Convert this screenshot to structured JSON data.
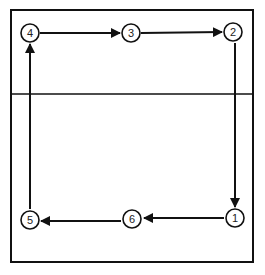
{
  "diagram": {
    "type": "flow-sequence",
    "court": {
      "outer": {
        "x": 11,
        "y": 10,
        "w": 242,
        "h": 252
      },
      "divider_y": 94
    },
    "nodes": [
      {
        "id": "1",
        "label": "1",
        "x": 235,
        "y": 218
      },
      {
        "id": "2",
        "label": "2",
        "x": 233,
        "y": 32
      },
      {
        "id": "3",
        "label": "3",
        "x": 131,
        "y": 33
      },
      {
        "id": "4",
        "label": "4",
        "x": 30,
        "y": 33
      },
      {
        "id": "5",
        "label": "5",
        "x": 30,
        "y": 220
      },
      {
        "id": "6",
        "label": "6",
        "x": 133,
        "y": 218
      }
    ],
    "edges": [
      {
        "from": "2",
        "to": "1",
        "direction": "down"
      },
      {
        "from": "1",
        "to": "6",
        "direction": "left"
      },
      {
        "from": "6",
        "to": "5",
        "direction": "left"
      },
      {
        "from": "5",
        "to": "4",
        "direction": "up"
      },
      {
        "from": "4",
        "to": "3",
        "direction": "right"
      },
      {
        "from": "3",
        "to": "2",
        "direction": "right"
      }
    ],
    "colors": {
      "stroke": "#111111",
      "background": "#ffffff"
    }
  }
}
